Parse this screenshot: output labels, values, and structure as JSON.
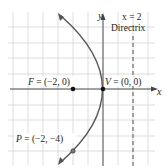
{
  "diagram": {
    "axes": {
      "x_label": "x",
      "y_label": "y"
    },
    "directrix": {
      "equation": "x = 2",
      "label": "Directrix"
    },
    "points": {
      "focus": {
        "name": "F",
        "coords": "(−2, 0)"
      },
      "vertex": {
        "name": "V",
        "coords": "(0, 0)"
      },
      "point": {
        "name": "P",
        "coords": "(−2, −4)"
      }
    },
    "colors": {
      "grid": "#d0d0d0",
      "axis": "#333333",
      "curve": "#444444",
      "text": "#222222"
    }
  }
}
